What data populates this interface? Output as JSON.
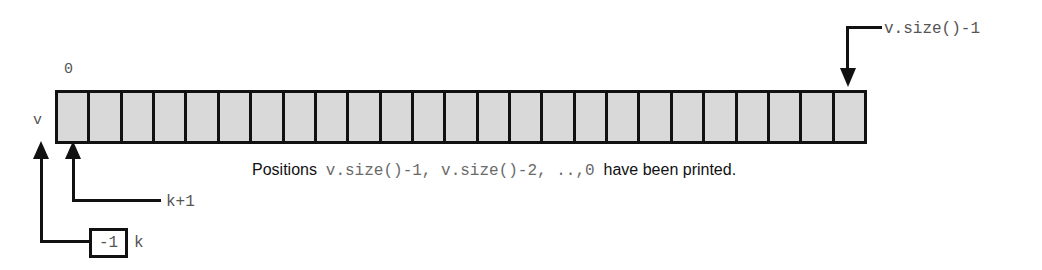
{
  "diagram": {
    "type": "array-invariant-diagram",
    "array": {
      "name_label": "v",
      "start_index_label": "0",
      "end_index_label": "v.size()-1",
      "cell_count": 25,
      "cell_fill_color": "#d9d9d9",
      "border_color": "#111111"
    },
    "pointers": [
      {
        "name": "k-plus-one",
        "label": "k+1",
        "target": "left edge of array"
      },
      {
        "name": "k",
        "label": "k",
        "value": "-1",
        "target": "left of array start"
      }
    ],
    "top_pointer": {
      "name": "v-size-minus-one",
      "label": "v.size()-1",
      "target": "last cell of array"
    },
    "caption": {
      "segment_1": "Positions",
      "segment_2": "v.size()-1, v.size()-2, ..,0",
      "segment_3": "have been printed."
    }
  }
}
